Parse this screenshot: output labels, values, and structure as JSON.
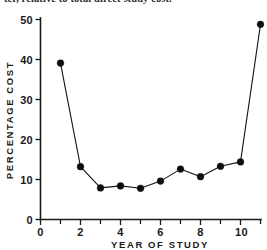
{
  "figure": {
    "caption_fragment": "ter, relative to total direct study cost."
  },
  "chart_data": {
    "type": "line",
    "title": "",
    "xlabel": "YEAR OF STUDY",
    "ylabel": "PERCENTAGE COST",
    "x": [
      1,
      2,
      3,
      4,
      5,
      6,
      7,
      8,
      9,
      10,
      11
    ],
    "values": [
      39.1,
      13.2,
      7.9,
      8.4,
      7.8,
      9.6,
      12.6,
      10.7,
      13.3,
      14.4,
      48.8
    ],
    "series": [
      {
        "name": "Percentage cost",
        "x": [
          1,
          2,
          3,
          4,
          5,
          6,
          7,
          8,
          9,
          10,
          11
        ],
        "values": [
          39.1,
          13.2,
          7.9,
          8.4,
          7.8,
          9.6,
          12.6,
          10.7,
          13.3,
          14.4,
          48.8
        ]
      }
    ],
    "xlim": [
      0,
      11.5
    ],
    "ylim": [
      0,
      50
    ],
    "xticks": [
      0,
      2,
      4,
      6,
      8,
      10
    ],
    "xticklabels": [
      "0",
      "2",
      "4",
      "6",
      "8",
      "10"
    ],
    "xminorticks": [
      1,
      3,
      5,
      7,
      9,
      11
    ],
    "yticks": [
      0,
      10,
      20,
      30,
      40,
      50
    ],
    "yticklabels": [
      "0",
      "10",
      "20",
      "30",
      "40",
      "50"
    ],
    "grid": false,
    "legend": false,
    "marker": "filled-circle",
    "line_color": "#141414",
    "marker_color": "#0d0d0d",
    "axis_color": "#1a1a1a",
    "background": "#ffffff"
  }
}
